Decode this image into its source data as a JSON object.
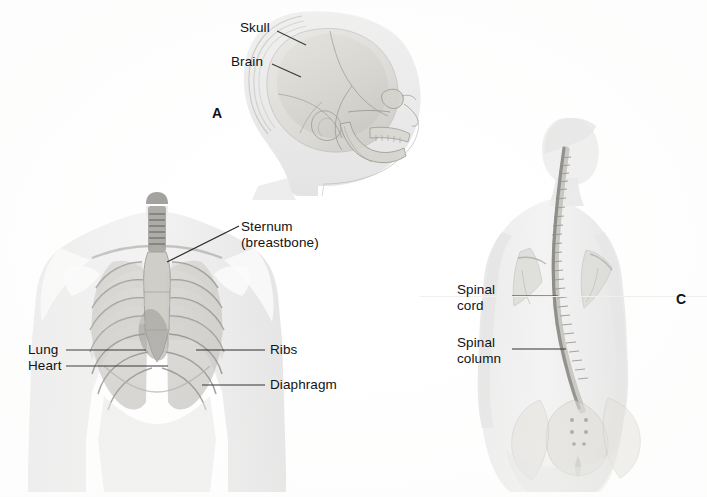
{
  "figure": {
    "background_color": "#ffffff",
    "ink_color": "#121212",
    "panels": [
      {
        "id": "A",
        "letter": "A",
        "subject": "lateral-head-skull-brain",
        "labels": [
          {
            "key": "skull",
            "text": "Skull"
          },
          {
            "key": "brain",
            "text": "Brain"
          }
        ]
      },
      {
        "id": "B",
        "letter": "",
        "subject": "anterior-thorax-ribcage",
        "labels": [
          {
            "key": "sternum_line1",
            "text": "Sternum"
          },
          {
            "key": "sternum_line2",
            "text": "(breastbone)"
          },
          {
            "key": "lung",
            "text": "Lung"
          },
          {
            "key": "heart",
            "text": "Heart"
          },
          {
            "key": "ribs",
            "text": "Ribs"
          },
          {
            "key": "diaphragm",
            "text": "Diaphragm"
          }
        ]
      },
      {
        "id": "C",
        "letter": "C",
        "subject": "posterior-torso-spine",
        "labels": [
          {
            "key": "spinal_cord_line1",
            "text": "Spinal"
          },
          {
            "key": "spinal_cord_line2",
            "text": "cord"
          },
          {
            "key": "spinal_column_line1",
            "text": "Spinal"
          },
          {
            "key": "spinal_column_line2",
            "text": "column"
          }
        ]
      }
    ]
  },
  "palette": {
    "skin_light": "#ececec",
    "skin_mid": "#dedede",
    "bone_light": "#e2e0da",
    "bone_mid": "#c9c7c0",
    "bone_dark": "#a9a7a0",
    "organ_mid": "#b9b7b2",
    "organ_dark": "#8e8c88",
    "outline": "#9a9892",
    "leader": "#141414"
  }
}
